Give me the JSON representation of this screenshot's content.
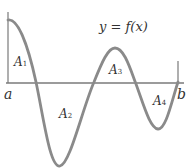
{
  "diagram": {
    "function_label": "y = f(x)",
    "x_axis": {
      "left_label": "a",
      "right_label": "b"
    },
    "regions": [
      {
        "name": "A",
        "sub": "1"
      },
      {
        "name": "A",
        "sub": "2"
      },
      {
        "name": "A",
        "sub": "3"
      },
      {
        "name": "A",
        "sub": "4"
      }
    ],
    "colors": {
      "curve": "#8a8a8a",
      "axis": "#7a7a7a",
      "text": "#333333"
    }
  }
}
